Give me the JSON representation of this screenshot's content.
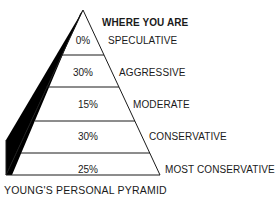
{
  "title": "WHERE YOU ARE",
  "caption": "YOUNG'S PERSONAL PYRAMID",
  "tiers": [
    {
      "label": "SPECULATIVE",
      "percent": "0%"
    },
    {
      "label": "AGGRESSIVE",
      "percent": "30%"
    },
    {
      "label": "MODERATE",
      "percent": "15%"
    },
    {
      "label": "CONSERVATIVE",
      "percent": "30%"
    },
    {
      "label": "MOST CONSERVATIVE",
      "percent": "25%"
    }
  ],
  "colors": {
    "line": "#1a1a1a",
    "shadow": "#000000",
    "background": "#ffffff"
  }
}
